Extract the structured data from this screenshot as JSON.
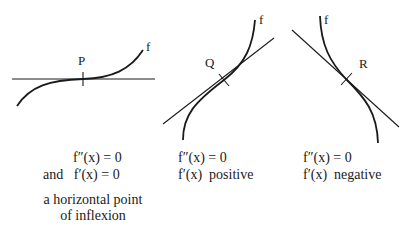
{
  "diagrams": [
    {
      "id": "P",
      "point_label": "P",
      "curve_label": "f",
      "tangent": "horizontal",
      "caption": {
        "line1": "f″(x) = 0",
        "line2_prefix": "and",
        "line2": "f′(x) = 0",
        "description_line1": "a horizontal point",
        "description_line2": "of inflexion"
      }
    },
    {
      "id": "Q",
      "point_label": "Q",
      "curve_label": "f",
      "tangent": "positive slope",
      "caption": {
        "line1": "f″(x) = 0",
        "line2": "f′(x)  positive"
      }
    },
    {
      "id": "R",
      "point_label": "R",
      "curve_label": "f",
      "tangent": "negative slope",
      "caption": {
        "line1": "f″(x) = 0",
        "line2": "f′(x)  negative"
      }
    }
  ],
  "colors": {
    "ink": "#1a1a1a",
    "background": "#ffffff"
  }
}
